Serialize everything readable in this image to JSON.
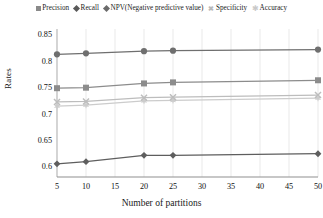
{
  "chart_data": {
    "type": "line",
    "title": "",
    "xlabel": "Number of partitions",
    "ylabel": "Rates",
    "x": [
      5,
      10,
      20,
      25,
      50
    ],
    "xticks": [
      5,
      10,
      15,
      20,
      25,
      30,
      35,
      40,
      45,
      50
    ],
    "yticks": [
      0.6,
      0.65,
      0.7,
      0.75,
      0.8,
      0.85
    ],
    "ytick_labels": [
      "0.6",
      "0.65",
      "0.7",
      "0.75",
      "0.8",
      "0.85"
    ],
    "xlim": [
      5,
      50
    ],
    "ylim": [
      0.58,
      0.86
    ],
    "grid": "vertical",
    "legend_position": "top",
    "series": [
      {
        "name": "Precision",
        "marker": "circle",
        "color": "#6f6f6f",
        "values": [
          0.812,
          0.814,
          0.818,
          0.819,
          0.821
        ]
      },
      {
        "name": "Recall",
        "marker": "diamond",
        "color": "#5e5e5e",
        "values": [
          0.605,
          0.609,
          0.621,
          0.621,
          0.624
        ]
      },
      {
        "name": "NPV(Negative predictive value)",
        "marker": "square",
        "color": "#8c8c8c",
        "values": [
          0.748,
          0.749,
          0.757,
          0.759,
          0.763
        ]
      },
      {
        "name": "Specificity",
        "marker": "x",
        "color": "#bdbdbd",
        "values": [
          0.722,
          0.723,
          0.73,
          0.731,
          0.735
        ]
      },
      {
        "name": "Accuracy",
        "marker": "star",
        "color": "#cccccc",
        "values": [
          0.714,
          0.716,
          0.724,
          0.725,
          0.729
        ]
      }
    ]
  },
  "legend": {
    "items": [
      {
        "label": "Precision",
        "marker": "square-icon"
      },
      {
        "label": "Recall",
        "marker": "diamond-icon"
      },
      {
        "label": "NPV(Negative predictive value)",
        "marker": "diamond-icon"
      },
      {
        "label": "Specificity",
        "marker": "x-icon"
      },
      {
        "label": "Accuracy",
        "marker": "star-icon"
      }
    ]
  },
  "axes": {
    "y_title": "Rates",
    "x_title": "Number of partitions"
  },
  "colors": {
    "grid": "#e6e6e6",
    "axis": "#9a9a9a",
    "text": "#1a1a1a"
  }
}
